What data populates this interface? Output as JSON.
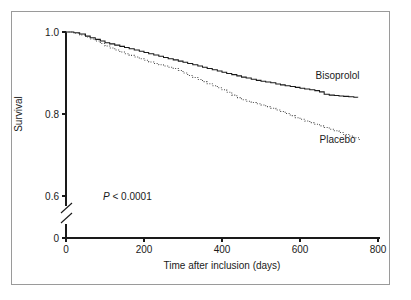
{
  "figure": {
    "caption_present": false,
    "background_color": "#ffffff",
    "frame_color": "#9a9a9a",
    "ink_color": "#1a1a1a"
  },
  "chart_data": {
    "type": "line",
    "subtype": "kaplan-meier-survival-step",
    "title": "",
    "subtitle": "",
    "xlabel": "Time after inclusion (days)",
    "ylabel": "Survival",
    "xlim": [
      0,
      800
    ],
    "ylim_upper_segment": [
      0.6,
      1.0
    ],
    "y_axis_has_break": true,
    "y_break_between": [
      0,
      0.6
    ],
    "grid": false,
    "legend_position": "inline-right-of-curves",
    "xticks": [
      0,
      200,
      400,
      600,
      800
    ],
    "xticklabels": [
      "0",
      "200",
      "400",
      "600",
      "800"
    ],
    "yticks": [
      0,
      0.6,
      0.8,
      1.0
    ],
    "yticklabels": [
      "0",
      "0.6",
      "0.8",
      "1.0"
    ],
    "annotations": [
      {
        "name": "p-value",
        "text_italic": "P",
        "text_rest": " < 0.0001",
        "full_text": "P < 0.0001",
        "x_days": 95,
        "y_survival": 0.6
      }
    ],
    "series": [
      {
        "name": "Bisoprolol",
        "line_style": "solid",
        "color": "#1a1a1a",
        "label_x_days": 640,
        "label_y_survival": 0.893,
        "x": [
          0,
          20,
          35,
          50,
          62,
          75,
          88,
          100,
          112,
          125,
          138,
          150,
          162,
          175,
          188,
          200,
          212,
          225,
          238,
          250,
          262,
          275,
          288,
          300,
          312,
          325,
          338,
          350,
          362,
          375,
          388,
          400,
          412,
          425,
          438,
          450,
          462,
          475,
          488,
          500,
          512,
          525,
          538,
          550,
          562,
          575,
          588,
          600,
          612,
          625,
          638,
          650,
          662,
          675,
          688,
          700,
          712,
          725,
          738,
          748
        ],
        "y": [
          1.0,
          0.998,
          0.995,
          0.99,
          0.986,
          0.982,
          0.978,
          0.974,
          0.971,
          0.968,
          0.965,
          0.962,
          0.959,
          0.956,
          0.953,
          0.95,
          0.947,
          0.944,
          0.941,
          0.938,
          0.935,
          0.932,
          0.929,
          0.926,
          0.923,
          0.92,
          0.917,
          0.914,
          0.911,
          0.908,
          0.905,
          0.902,
          0.899,
          0.896,
          0.893,
          0.89,
          0.888,
          0.885,
          0.882,
          0.88,
          0.878,
          0.876,
          0.873,
          0.871,
          0.869,
          0.867,
          0.865,
          0.863,
          0.861,
          0.859,
          0.857,
          0.854,
          0.848,
          0.846,
          0.845,
          0.844,
          0.843,
          0.842,
          0.841,
          0.84
        ]
      },
      {
        "name": "Placebo",
        "line_style": "dotted",
        "color": "#4a4a4a",
        "label_x_days": 650,
        "label_y_survival": 0.737,
        "x": [
          0,
          20,
          35,
          50,
          62,
          75,
          88,
          100,
          112,
          125,
          138,
          150,
          162,
          175,
          188,
          200,
          212,
          225,
          238,
          250,
          262,
          275,
          288,
          300,
          312,
          325,
          338,
          350,
          362,
          375,
          388,
          400,
          412,
          425,
          438,
          450,
          462,
          475,
          488,
          500,
          512,
          525,
          538,
          550,
          562,
          575,
          588,
          600,
          612,
          625,
          638,
          650,
          662,
          675,
          688,
          700,
          712,
          725,
          738,
          752
        ],
        "y": [
          1.0,
          0.997,
          0.993,
          0.988,
          0.983,
          0.978,
          0.972,
          0.966,
          0.961,
          0.956,
          0.951,
          0.947,
          0.943,
          0.939,
          0.935,
          0.931,
          0.927,
          0.923,
          0.92,
          0.917,
          0.914,
          0.911,
          0.906,
          0.9,
          0.894,
          0.889,
          0.884,
          0.879,
          0.874,
          0.869,
          0.864,
          0.859,
          0.853,
          0.846,
          0.84,
          0.835,
          0.831,
          0.828,
          0.825,
          0.822,
          0.818,
          0.814,
          0.81,
          0.806,
          0.801,
          0.796,
          0.791,
          0.787,
          0.783,
          0.779,
          0.775,
          0.771,
          0.767,
          0.763,
          0.759,
          0.755,
          0.75,
          0.746,
          0.742,
          0.735
        ]
      }
    ]
  }
}
